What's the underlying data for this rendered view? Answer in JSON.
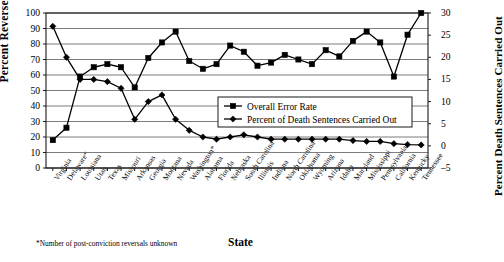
{
  "chart_data": {
    "type": "line",
    "title": "",
    "xlabel": "State",
    "ylabel": "Percent Reversed",
    "ylabel_secondary": "Percent Death Sentences Carried Out",
    "ylim": [
      0,
      100
    ],
    "ylim_secondary": [
      -5,
      30
    ],
    "yticks": [
      0,
      10,
      20,
      30,
      40,
      50,
      60,
      70,
      80,
      90,
      100
    ],
    "yticks_secondary": [
      -5,
      0,
      5,
      10,
      15,
      20,
      25,
      30
    ],
    "grid": true,
    "legend_position": "center-right",
    "footnote": "*Number of post-conviction reversals unknown",
    "categories": [
      "Virginia",
      "Delaware*",
      "Louisiana",
      "Utah",
      "Texas",
      "Missouri",
      "Arkansas",
      "Georgia",
      "Montana",
      "Nevada",
      "Washington*",
      "Alabama",
      "Florida",
      "Nebraska",
      "South Carolina",
      "Illinois",
      "Indiana",
      "North Carolina",
      "Oklahoma",
      "Wyoming",
      "Arizona",
      "Idaho",
      "Maryland",
      "Mississippi",
      "Pennsylvania",
      "California",
      "Kentucky",
      "Tennessee"
    ],
    "series": [
      {
        "name": "Overall Error Rate",
        "axis": "left",
        "marker": "square",
        "values": [
          18,
          26,
          59,
          65,
          67,
          65,
          52,
          71,
          81,
          88,
          69,
          64,
          67,
          79,
          75,
          66,
          68,
          73,
          70,
          67,
          76,
          72,
          82,
          88,
          81,
          59,
          86,
          100
        ]
      },
      {
        "name": "Percent of Death Sentences Carried Out",
        "axis": "right",
        "marker": "diamond",
        "values": [
          27,
          20,
          15,
          15,
          14.5,
          13,
          6,
          10,
          11.5,
          6,
          3.5,
          2,
          1.5,
          2,
          2.5,
          2,
          1.5,
          1.5,
          1.5,
          1.5,
          1.5,
          1.5,
          1.2,
          1,
          1,
          0.5,
          0.3,
          0.2
        ]
      }
    ],
    "legend": [
      {
        "label": "Overall Error Rate",
        "marker": "square"
      },
      {
        "label": "Percent of Death Sentences Carried Out",
        "marker": "diamond"
      }
    ]
  }
}
